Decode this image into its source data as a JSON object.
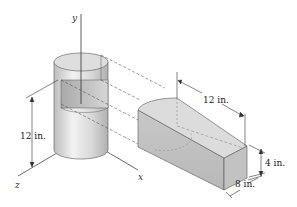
{
  "figure": {
    "axes": {
      "y": "y",
      "x": "x",
      "z": "z"
    },
    "dimensions": {
      "cylinder_height": "12 in.",
      "block_length": "12 in.",
      "block_height": "4 in.",
      "block_width": "8 in."
    },
    "colors": {
      "line": "#333333",
      "dashed": "#555555",
      "surface_light": "#e6e6e6",
      "surface_mid": "#cfcfcf",
      "surface_dark": "#b5b5b5"
    }
  }
}
